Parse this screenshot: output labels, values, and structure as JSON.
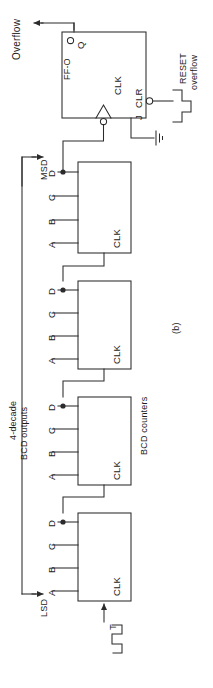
{
  "figure": {
    "caption": "(b)",
    "type": "logic-schematic",
    "orientation": "rotated-90"
  },
  "signals": {
    "overflow_out": "Overflow",
    "reset_line_1": "RESET",
    "reset_line_2": "overflow",
    "clock_input": "T",
    "msd": "MSD",
    "lsd": "LSD"
  },
  "bus_label": {
    "line1": "4-decade",
    "line2": "BCD outputs"
  },
  "counters_label": "BCD counters",
  "flipflop": {
    "name": "FF-O",
    "q_pin": "Q",
    "clk_pin": "CLK",
    "j_pin": "J",
    "clr_pin": "CLR"
  },
  "counters": [
    {
      "id": "counter-1",
      "clk": "CLK",
      "pins": [
        "D",
        "C",
        "B",
        "A"
      ]
    },
    {
      "id": "counter-2",
      "clk": "CLK",
      "pins": [
        "D",
        "C",
        "B",
        "A"
      ]
    },
    {
      "id": "counter-3",
      "clk": "CLK",
      "pins": [
        "D",
        "C",
        "B",
        "A"
      ]
    },
    {
      "id": "counter-4",
      "clk": "CLK",
      "pins": [
        "D",
        "C",
        "B",
        "A"
      ]
    }
  ],
  "colors": {
    "line": "#2b2b2b",
    "text": "#1c1c1c",
    "background": "#ffffff"
  }
}
